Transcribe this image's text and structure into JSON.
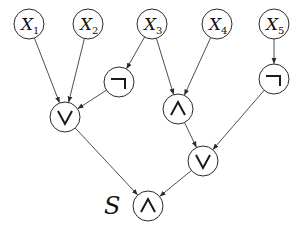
{
  "diagram": {
    "type": "logic-circuit-tree",
    "root_label": "S",
    "colors": {
      "stroke": "#2a2a2a",
      "background": "#ffffff"
    },
    "nodes": [
      {
        "id": "x1",
        "kind": "variable",
        "label": "X",
        "subscript": "1",
        "x": 29,
        "y": 24
      },
      {
        "id": "x2",
        "kind": "variable",
        "label": "X",
        "subscript": "2",
        "x": 88,
        "y": 24
      },
      {
        "id": "x3",
        "kind": "variable",
        "label": "X",
        "subscript": "3",
        "x": 152,
        "y": 24
      },
      {
        "id": "x4",
        "kind": "variable",
        "label": "X",
        "subscript": "4",
        "x": 217,
        "y": 24
      },
      {
        "id": "x5",
        "kind": "variable",
        "label": "X",
        "subscript": "5",
        "x": 274,
        "y": 24
      },
      {
        "id": "not1",
        "kind": "gate",
        "gate": "NOT",
        "symbol": "¬",
        "x": 119,
        "y": 82
      },
      {
        "id": "not2",
        "kind": "gate",
        "gate": "NOT",
        "symbol": "¬",
        "x": 274,
        "y": 79
      },
      {
        "id": "or1",
        "kind": "gate",
        "gate": "OR",
        "symbol": "∨",
        "x": 65,
        "y": 117
      },
      {
        "id": "and1",
        "kind": "gate",
        "gate": "AND",
        "symbol": "∧",
        "x": 178,
        "y": 109
      },
      {
        "id": "or2",
        "kind": "gate",
        "gate": "OR",
        "symbol": "∨",
        "x": 203,
        "y": 161
      },
      {
        "id": "and_root",
        "kind": "gate",
        "gate": "AND",
        "symbol": "∧",
        "x": 148,
        "y": 206
      }
    ],
    "edges": [
      {
        "from": "x1",
        "to": "or1"
      },
      {
        "from": "x2",
        "to": "or1"
      },
      {
        "from": "x3",
        "to": "not1"
      },
      {
        "from": "x3",
        "to": "and1"
      },
      {
        "from": "x4",
        "to": "and1"
      },
      {
        "from": "x5",
        "to": "not2"
      },
      {
        "from": "not1",
        "to": "or1"
      },
      {
        "from": "or1",
        "to": "and_root"
      },
      {
        "from": "and1",
        "to": "or2"
      },
      {
        "from": "not2",
        "to": "or2"
      },
      {
        "from": "or2",
        "to": "and_root"
      }
    ],
    "node_radius": 15
  }
}
